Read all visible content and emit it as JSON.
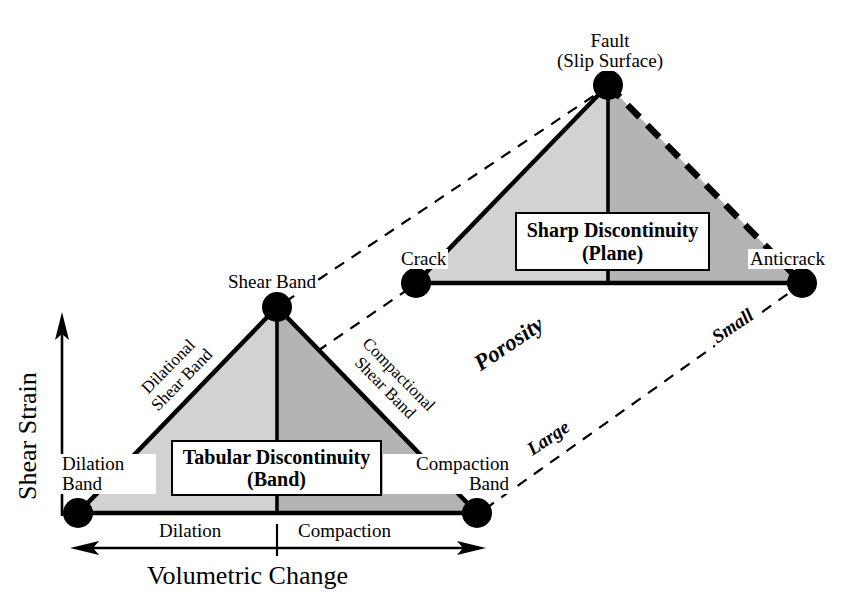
{
  "figure": {
    "type": "conceptual-diagram"
  },
  "axes": {
    "y_title": "Shear Strain",
    "x_title": "Volumetric Change",
    "x_left_label": "Dilation",
    "x_right_label": "Compaction"
  },
  "lower_triangle": {
    "callout_line1": "Tabular Discontinuity",
    "callout_line2": "(Band)",
    "apex_label": "Shear Band",
    "left_vertex_line1": "Dilation",
    "left_vertex_line2": "Band",
    "right_vertex_line1": "Compaction",
    "right_vertex_line2": "Band",
    "left_leg_line1": "Dilational",
    "left_leg_line2": "Shear Band",
    "right_leg_line1": "Compactional",
    "right_leg_line2": "Shear Band"
  },
  "upper_triangle": {
    "callout_line1": "Sharp Discontinuity",
    "callout_line2": "(Plane)",
    "apex_line1": "Fault",
    "apex_line2": "(Slip Surface)",
    "left_vertex_label": "Crack",
    "right_vertex_label": "Anticrack"
  },
  "connectors": {
    "porosity_label": "Porosity",
    "large_label": "Large",
    "small_label": "Small"
  },
  "colors": {
    "fill_light": "#d2d2d2",
    "fill_dark": "#b4b4b4",
    "stroke": "#000000",
    "background": "#ffffff"
  },
  "geometry": {
    "lower": {
      "apex": [
        277,
        307
      ],
      "left": [
        78,
        513
      ],
      "right": [
        477,
        513
      ]
    },
    "upper": {
      "apex": [
        608,
        85
      ],
      "left": [
        416,
        283
      ],
      "right": [
        802,
        283
      ]
    }
  }
}
